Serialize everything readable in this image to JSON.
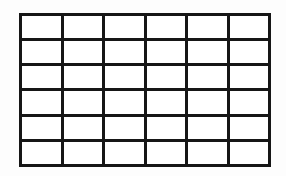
{
  "figure": {
    "title": "",
    "grid": {
      "rows": 6,
      "columns": 6,
      "line_color": "#161616",
      "cell_background": "#ffffff",
      "page_background": "#fdfdfd",
      "cell_text": ""
    }
  }
}
